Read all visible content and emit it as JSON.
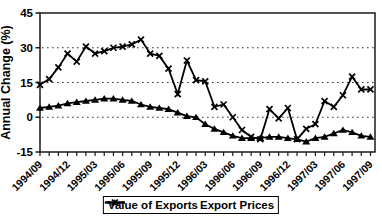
{
  "chart_data": {
    "type": "line",
    "title": "",
    "xlabel": "",
    "ylabel": "Annual Change (%)",
    "ylim": [
      -15,
      45
    ],
    "yticks": [
      45,
      30,
      15,
      0,
      -15
    ],
    "gridlines_at": [
      30,
      15,
      0
    ],
    "grid_style": "dotted",
    "x_label_every": 3,
    "legend_position": "bottom",
    "x": [
      "1994/09",
      "1994/10",
      "1994/11",
      "1994/12",
      "1995/01",
      "1995/02",
      "1995/03",
      "1995/04",
      "1995/05",
      "1995/06",
      "1995/07",
      "1995/08",
      "1995/09",
      "1995/10",
      "1995/11",
      "1995/12",
      "1996/01",
      "1996/02",
      "1996/03",
      "1996/04",
      "1996/05",
      "1996/06",
      "1996/07",
      "1996/08",
      "1996/09",
      "1996/10",
      "1996/11",
      "1996/12",
      "1997/01",
      "1997/02",
      "1997/03",
      "1997/04",
      "1997/05",
      "1997/06",
      "1997/07",
      "1997/08",
      "1997/09"
    ],
    "x_tick_labels": [
      "1994/09",
      "1994/12",
      "1995/03",
      "1995/06",
      "1995/09",
      "1995/12",
      "1996/03",
      "1996/06",
      "1996/09",
      "1996/12",
      "1997/03",
      "1997/06",
      "1997/09"
    ],
    "series": [
      {
        "name": "Value of Exports",
        "marker": "x",
        "values": [
          14,
          16.5,
          21.5,
          27.5,
          24,
          30.5,
          27.5,
          28.5,
          30,
          30.5,
          31.5,
          33.5,
          27.5,
          26.5,
          21,
          10,
          24.5,
          16,
          15.5,
          4.5,
          5.5,
          0,
          -5.5,
          -8.5,
          -9.5,
          3.5,
          -0.5,
          4,
          -9.5,
          -5,
          -3,
          7,
          4.5,
          9.5,
          17.5,
          12,
          12
        ]
      },
      {
        "name": "Export Prices",
        "marker": "triangle",
        "values": [
          4,
          4.5,
          5,
          6,
          6.5,
          7,
          7.5,
          8,
          8,
          7.5,
          7,
          5.5,
          4.5,
          4,
          3.5,
          2,
          0.5,
          0,
          -3,
          -5,
          -6.5,
          -8,
          -9,
          -9,
          -9,
          -8.5,
          -8.5,
          -9,
          -9.5,
          -10.5,
          -9,
          -8.5,
          -7,
          -5.5,
          -6.5,
          -8,
          -8.5
        ]
      }
    ],
    "colors": {
      "line": "#000000",
      "axis": "#1a1a1a",
      "grid": "#333333",
      "background": "#ffffff"
    }
  }
}
